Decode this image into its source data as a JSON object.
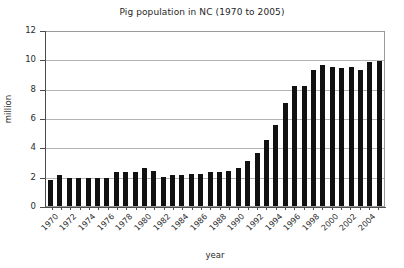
{
  "chart_data": {
    "type": "bar",
    "title": "Pig population in NC (1970 to 2005)",
    "xlabel": "year",
    "ylabel": "million",
    "ylim": [
      0,
      12
    ],
    "yticks": [
      0,
      2,
      4,
      6,
      8,
      10,
      12
    ],
    "grid": true,
    "legend": null,
    "bar_color": "#111111",
    "grid_color": "#b5b5b5",
    "axis_color": "#4d4d4d",
    "categories": [
      "1970",
      "1971",
      "1972",
      "1973",
      "1974",
      "1975",
      "1976",
      "1977",
      "1978",
      "1979",
      "1980",
      "1981",
      "1982",
      "1983",
      "1984",
      "1985",
      "1986",
      "1987",
      "1988",
      "1989",
      "1990",
      "1991",
      "1992",
      "1993",
      "1994",
      "1995",
      "1996",
      "1997",
      "1998",
      "1999",
      "2000",
      "2001",
      "2002",
      "2003",
      "2004",
      "2005"
    ],
    "values": [
      1.8,
      2.1,
      1.9,
      1.9,
      1.9,
      1.9,
      1.9,
      2.3,
      2.3,
      2.3,
      2.6,
      2.4,
      2.0,
      2.1,
      2.1,
      2.2,
      2.2,
      2.3,
      2.3,
      2.4,
      2.6,
      3.1,
      3.6,
      4.5,
      5.5,
      7.0,
      8.2,
      8.2,
      9.3,
      9.6,
      9.5,
      9.4,
      9.5,
      9.3,
      9.8,
      9.9
    ],
    "xtick_labels": [
      "1970",
      "1972",
      "1974",
      "1976",
      "1978",
      "1980",
      "1982",
      "1984",
      "1986",
      "1988",
      "1990",
      "1992",
      "1994",
      "1996",
      "1998",
      "2000",
      "2002",
      "2004"
    ]
  }
}
